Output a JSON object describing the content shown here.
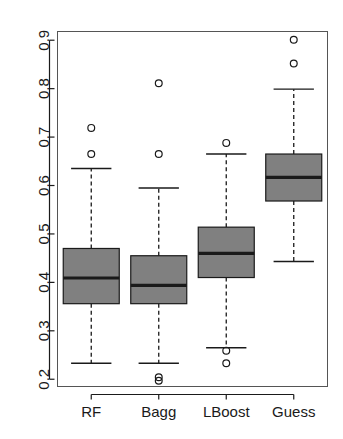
{
  "chart_data": {
    "type": "boxplot",
    "title": "",
    "xlabel": "",
    "ylabel": "",
    "categories": [
      "RF",
      "Bagg",
      "LBoost",
      "Guess"
    ],
    "ylim": [
      0.185,
      0.918
    ],
    "yticks": [
      0.2,
      0.3,
      0.4,
      0.5,
      0.6,
      0.7,
      0.8,
      0.9
    ],
    "ytick_labels": [
      "0.2",
      "0.3",
      "0.4",
      "0.5",
      "0.6",
      "0.7",
      "0.8",
      "0.9"
    ],
    "grid": false,
    "legend": null,
    "box_fill": "#808080",
    "box_stroke": "#1a1a1a",
    "series": [
      {
        "name": "RF",
        "whisker_low": 0.233,
        "q1": 0.356,
        "median": 0.409,
        "q3": 0.47,
        "whisker_high": 0.635,
        "outliers": [
          0.665,
          0.719
        ]
      },
      {
        "name": "Bagg",
        "whisker_low": 0.233,
        "q1": 0.356,
        "median": 0.394,
        "q3": 0.455,
        "whisker_high": 0.595,
        "outliers": [
          0.197,
          0.204,
          0.665,
          0.811
        ]
      },
      {
        "name": "LBoost",
        "whisker_low": 0.265,
        "q1": 0.41,
        "median": 0.46,
        "q3": 0.514,
        "whisker_high": 0.665,
        "outliers": [
          0.233,
          0.259,
          0.688
        ]
      },
      {
        "name": "Guess",
        "whisker_low": 0.443,
        "q1": 0.568,
        "median": 0.617,
        "q3": 0.665,
        "whisker_high": 0.799,
        "outliers": [
          0.852,
          0.901
        ]
      }
    ]
  }
}
